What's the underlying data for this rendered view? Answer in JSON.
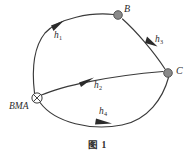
{
  "figure": {
    "caption": "图 1",
    "nodes": [
      {
        "id": "source",
        "label": "BMA",
        "glyph": "circled-x",
        "x": 37,
        "y": 98
      },
      {
        "id": "B",
        "label": "B",
        "glyph": "filled-dot",
        "x": 118,
        "y": 15
      },
      {
        "id": "C",
        "label": "C",
        "glyph": "filled-dot",
        "x": 168,
        "y": 73
      }
    ],
    "edges": [
      {
        "id": "h1",
        "label": "h",
        "subscript": "1",
        "from": "BMA",
        "to": "B",
        "direction": "arrow-up-right"
      },
      {
        "id": "h2",
        "label": "h",
        "subscript": "2",
        "from": "BMA",
        "to": "C",
        "direction": "arrow-right"
      },
      {
        "id": "h3",
        "label": "h",
        "subscript": "3",
        "from": "B",
        "to": "C",
        "direction": "arrow-down-right"
      },
      {
        "id": "h4",
        "label": "h",
        "subscript": "4",
        "from": "BMA",
        "to": "C",
        "direction": "arrow-right"
      }
    ],
    "colors": {
      "stroke": "#3a3a3a",
      "node_fill": "#8a8a8a",
      "arrow_fill": "#2b2b2b",
      "background": "#ffffff",
      "text": "#2b2b2b"
    }
  }
}
